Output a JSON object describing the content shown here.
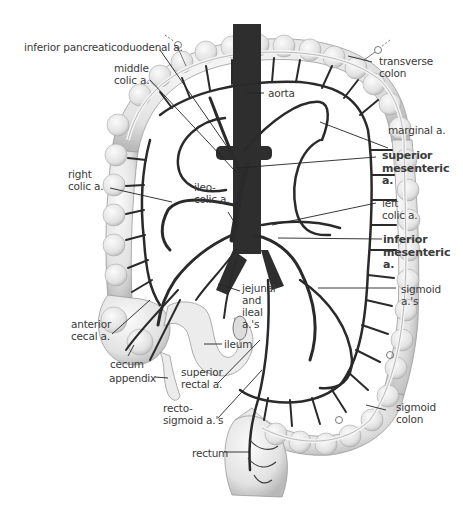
{
  "figure": {
    "colors": {
      "artery": "#2a2a2a",
      "aorta": "#2e2e2e",
      "colon_fill": "#ececec",
      "colon_shade": "#c8c8c8",
      "leader_line": "#222222",
      "text": "#3a3a3a"
    }
  },
  "labels": {
    "inferior_pancreaticoduodenal": [
      "inferior pancreaticoduodenal a."
    ],
    "middle_colic": [
      "middle",
      "colic a."
    ],
    "transverse_colon": [
      "transverse",
      "colon"
    ],
    "aorta": [
      "aorta"
    ],
    "marginal": [
      "marginal a."
    ],
    "superior_mesenteric": [
      "superior",
      "mesenteric",
      "a."
    ],
    "right_colic": [
      "right",
      "colic a."
    ],
    "ileocolic": [
      "ileo-",
      "colic a."
    ],
    "left_colic": [
      "left",
      "colic a."
    ],
    "inferior_mesenteric": [
      "inferior",
      "mesenteric",
      "a."
    ],
    "jejunal_ileal": [
      "jejunal",
      "and",
      "ileal",
      "a.'s"
    ],
    "sigmoid_arteries": [
      "sigmoid",
      "a.'s"
    ],
    "anterior_cecal": [
      "anterior",
      "cecal a."
    ],
    "ileum": [
      "ileum"
    ],
    "cecum": [
      "cecum"
    ],
    "appendix": [
      "appendix"
    ],
    "superior_rectal": [
      "superior",
      "rectal a."
    ],
    "rectosigmoid": [
      "recto-",
      "sigmoid a.'s"
    ],
    "sigmoid_colon": [
      "sigmoid",
      "colon"
    ],
    "rectum": [
      "rectum"
    ]
  }
}
